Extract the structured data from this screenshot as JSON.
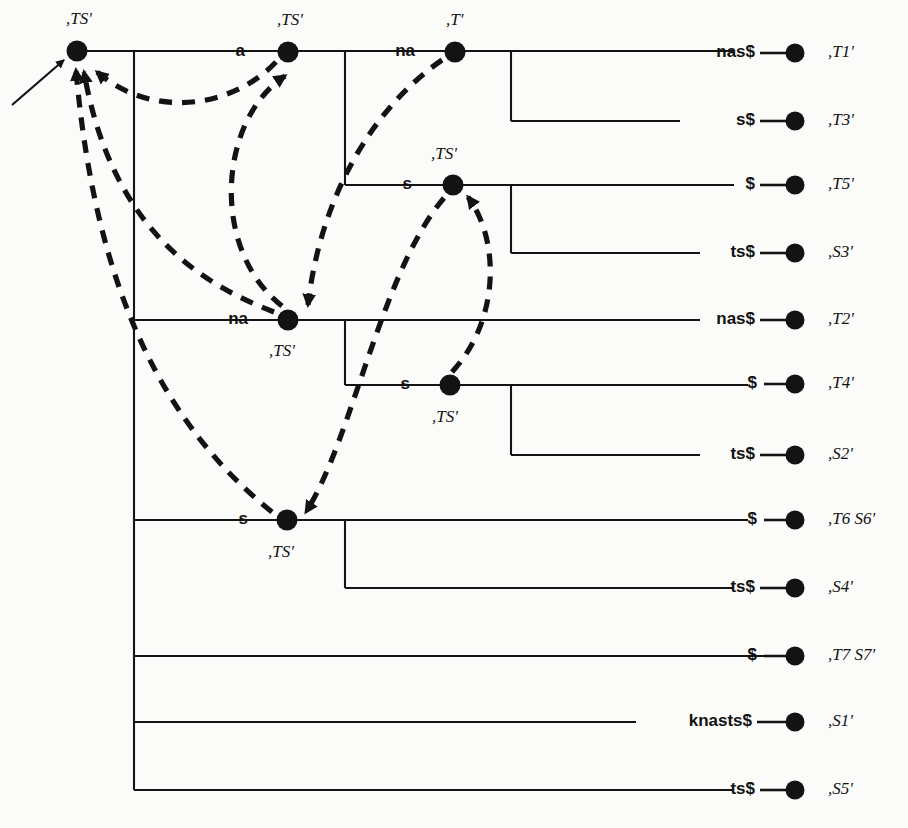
{
  "figure": {
    "kind": "suffix-tree-with-suffix-links",
    "width": 908,
    "height": 828,
    "background_color": "#fbfbf9",
    "line_color": "#141414",
    "node_color": "#131313"
  },
  "internal_nodes": [
    {
      "id": "root",
      "label": ",TS'",
      "x": 77,
      "y": 51,
      "label_x": 66,
      "label_y": 20,
      "incoming_edge_label": ""
    },
    {
      "id": "n_a",
      "label": ",TS'",
      "x": 288,
      "y": 52,
      "label_x": 277,
      "label_y": 21,
      "incoming_edge_label": "a"
    },
    {
      "id": "n_na",
      "label": ",T'",
      "x": 455,
      "y": 52,
      "label_x": 446,
      "label_y": 21,
      "incoming_edge_label": "na"
    },
    {
      "id": "n_as",
      "label": ",TS'",
      "x": 453,
      "y": 185,
      "label_x": 431,
      "label_y": 155,
      "incoming_edge_label": "s"
    },
    {
      "id": "n_na2",
      "label": ",TS'",
      "x": 288,
      "y": 320,
      "label_x": 269,
      "label_y": 352,
      "incoming_edge_label": "na"
    },
    {
      "id": "n_s2",
      "label": ",TS'",
      "x": 450,
      "y": 385,
      "label_x": 432,
      "label_y": 418,
      "incoming_edge_label": "s"
    },
    {
      "id": "n_s3",
      "label": ",TS'",
      "x": 287,
      "y": 520,
      "label_x": 268,
      "label_y": 553,
      "incoming_edge_label": "s"
    }
  ],
  "leaves": [
    {
      "id": "L1",
      "edge_label": "nas$",
      "label": ",T1'",
      "y": 53,
      "line_from_x": 345,
      "dot_x": 795,
      "label_x": 828
    },
    {
      "id": "L2",
      "edge_label": "s$",
      "label": ",T3'",
      "y": 121,
      "line_from_x": 511,
      "dot_x": 795,
      "label_x": 828
    },
    {
      "id": "L3",
      "edge_label": "$",
      "label": ",T5'",
      "y": 185,
      "line_from_x": 511,
      "dot_x": 795,
      "label_x": 828
    },
    {
      "id": "L4",
      "edge_label": "ts$",
      "label": ",S3'",
      "y": 253,
      "line_from_x": 511,
      "dot_x": 795,
      "label_x": 828
    },
    {
      "id": "L5",
      "edge_label": "nas$",
      "label": ",T2'",
      "y": 320,
      "line_from_x": 345,
      "dot_x": 795,
      "label_x": 828
    },
    {
      "id": "L6",
      "edge_label": "$",
      "label": ",T4'",
      "y": 384,
      "line_from_x": 511,
      "dot_x": 795,
      "label_x": 828
    },
    {
      "id": "L7",
      "edge_label": "ts$",
      "label": ",S2'",
      "y": 455,
      "line_from_x": 511,
      "dot_x": 795,
      "label_x": 828
    },
    {
      "id": "L8",
      "edge_label": "$",
      "label": ",T6 S6'",
      "y": 520,
      "line_from_x": 345,
      "dot_x": 795,
      "label_x": 828
    },
    {
      "id": "L9",
      "edge_label": "ts$",
      "label": ",S4'",
      "y": 588,
      "line_from_x": 345,
      "dot_x": 795,
      "label_x": 828
    },
    {
      "id": "L10",
      "edge_label": "$",
      "label": ",T7 S7'",
      "y": 656,
      "line_from_x": 134,
      "dot_x": 795,
      "label_x": 828
    },
    {
      "id": "L11",
      "edge_label": "knasts$",
      "label": ",S1'",
      "y": 722,
      "line_from_x": 134,
      "dot_x": 795,
      "label_x": 828
    },
    {
      "id": "L12",
      "edge_label": "ts$",
      "label": ",S5'",
      "y": 790,
      "line_from_x": 134,
      "dot_x": 795,
      "label_x": 828
    }
  ],
  "suffix_links": [
    {
      "id": "SL1",
      "from_node": "n_a",
      "to_node": "root",
      "note": "a -> root"
    },
    {
      "id": "SL2",
      "from_node": "n_na2",
      "to_node": "root",
      "note": "na(lower) -> root"
    },
    {
      "id": "SL3",
      "from_node": "n_s3",
      "to_node": "root",
      "note": "s(lower) -> root"
    },
    {
      "id": "SL4",
      "from_node": "n_na2",
      "to_node": "n_a",
      "note": "na(lower) -> a"
    },
    {
      "id": "SL5",
      "from_node": "n_na",
      "to_node": "n_na2",
      "note": "na(top) -> na(lower)"
    },
    {
      "id": "SL6",
      "from_node": "n_s2",
      "to_node": "n_as",
      "note": "s(mid) -> as"
    },
    {
      "id": "SL7",
      "from_node": "n_as",
      "to_node": "n_s3",
      "note": "as -> s(lower)"
    }
  ],
  "entry_arrow": {
    "id": "entry",
    "label": "root-entry-arrow",
    "from_x": 12,
    "from_y": 105,
    "to_x": 68,
    "to_y": 57
  }
}
